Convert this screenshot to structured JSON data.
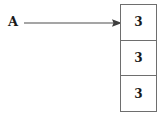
{
  "diagram": {
    "pointer": {
      "label": "A",
      "arrow_icon": "arrow-right-icon"
    },
    "array": {
      "cells": [
        {
          "value": "3"
        },
        {
          "value": "3"
        },
        {
          "value": "3"
        }
      ]
    },
    "colors": {
      "border": "#6e6e6e",
      "text": "#1a1a1a",
      "arrow": "#4d4d4d",
      "background": "#ffffff"
    }
  }
}
